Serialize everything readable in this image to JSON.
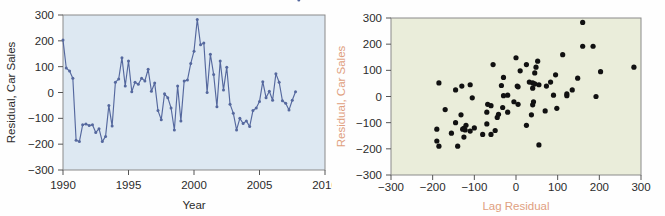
{
  "figure": {
    "background": "#fefefe",
    "panels": [
      "line-chart-residual-vs-year",
      "scatter-lag-residual"
    ]
  },
  "chart_data": [
    {
      "id": "left",
      "type": "line",
      "title": "",
      "subtitle": "",
      "xlabel": "Year",
      "ylabel": "Residual, Car Sales",
      "xlim": [
        1990,
        2010
      ],
      "ylim": [
        -300,
        300
      ],
      "xticks": [
        1990,
        1995,
        2000,
        2005,
        2010
      ],
      "xticklabels": [
        "1990",
        "1995",
        "2000",
        "2005",
        "2010"
      ],
      "yticks": [
        -300,
        -200,
        -100,
        0,
        100,
        200,
        300
      ],
      "yticklabels": [
        "−300",
        "−200",
        "−100",
        "0",
        "100",
        "200",
        "300"
      ],
      "grid": false,
      "legend": null,
      "plot_bgcolor": "#dde8f2",
      "line_color": "#55689e",
      "marker_color": "#55689e",
      "marker": "circle",
      "x": [
        1990.0,
        1990.25,
        1990.5,
        1990.75,
        1991.0,
        1991.25,
        1991.5,
        1991.75,
        1992.0,
        1992.25,
        1992.5,
        1992.75,
        1993.0,
        1993.25,
        1993.5,
        1993.75,
        1994.0,
        1994.25,
        1994.5,
        1994.75,
        1995.0,
        1995.25,
        1995.5,
        1995.75,
        1996.0,
        1996.25,
        1996.5,
        1996.75,
        1997.0,
        1997.25,
        1997.5,
        1997.75,
        1998.0,
        1998.25,
        1998.5,
        1998.75,
        1999.0,
        1999.25,
        1999.5,
        1999.75,
        2000.0,
        2000.25,
        2000.5,
        2000.75,
        2001.0,
        2001.25,
        2001.5,
        2001.75,
        2002.0,
        2002.25,
        2002.5,
        2002.75,
        2003.0,
        2003.25,
        2003.5,
        2003.75,
        2004.0,
        2004.25,
        2004.5,
        2004.75,
        2005.0,
        2005.25,
        2005.5,
        2005.75,
        2006.0,
        2006.25,
        2006.5,
        2006.75,
        2007.0,
        2007.25,
        2007.5,
        2007.75,
        2008.0
      ],
      "y": [
        203,
        95,
        83,
        55,
        -185,
        -190,
        -125,
        -122,
        -128,
        -125,
        -155,
        -140,
        -190,
        -170,
        -50,
        -130,
        40,
        52,
        135,
        25,
        122,
        3,
        40,
        32,
        55,
        45,
        90,
        5,
        37,
        -70,
        -105,
        -5,
        -20,
        -60,
        -145,
        25,
        -110,
        45,
        48,
        112,
        160,
        283,
        185,
        192,
        0,
        148,
        70,
        -55,
        122,
        10,
        98,
        -45,
        -80,
        -145,
        -100,
        -120,
        -110,
        -132,
        -70,
        -60,
        -35,
        42,
        -20,
        5,
        -30,
        73,
        40,
        -32,
        -42,
        -68,
        -30,
        3
      ]
    },
    {
      "id": "right",
      "type": "scatter",
      "title": "",
      "subtitle": "",
      "xlabel": "Lag Residual",
      "ylabel": "Residual, Car Sales",
      "xlim": [
        -300,
        300
      ],
      "ylim": [
        -300,
        300
      ],
      "xticks": [
        -300,
        -200,
        -100,
        0,
        100,
        200,
        300
      ],
      "xticklabels": [
        "−300",
        "−200",
        "−100",
        "0",
        "100",
        "200",
        "300"
      ],
      "yticks": [
        -300,
        -200,
        -100,
        0,
        100,
        200,
        300
      ],
      "yticklabels": [
        "−300",
        "−200",
        "−100",
        "0",
        "100",
        "200",
        "300"
      ],
      "grid": false,
      "legend": null,
      "plot_bgcolor": "#eaedda",
      "marker_color": "#111111",
      "marker": "circle",
      "axis_label_color": "#e0a080",
      "points": [
        [
          203,
          95
        ],
        [
          95,
          83
        ],
        [
          83,
          55
        ],
        [
          55,
          -185
        ],
        [
          -185,
          -190
        ],
        [
          -190,
          -125
        ],
        [
          -125,
          -122
        ],
        [
          -122,
          -128
        ],
        [
          -128,
          -125
        ],
        [
          -125,
          -155
        ],
        [
          -155,
          -140
        ],
        [
          -140,
          -190
        ],
        [
          -190,
          -170
        ],
        [
          -170,
          -50
        ],
        [
          -50,
          -130
        ],
        [
          -130,
          40
        ],
        [
          40,
          52
        ],
        [
          52,
          135
        ],
        [
          135,
          25
        ],
        [
          25,
          122
        ],
        [
          122,
          3
        ],
        [
          3,
          40
        ],
        [
          40,
          32
        ],
        [
          32,
          55
        ],
        [
          55,
          45
        ],
        [
          45,
          90
        ],
        [
          90,
          5
        ],
        [
          5,
          37
        ],
        [
          37,
          -70
        ],
        [
          -70,
          -105
        ],
        [
          -105,
          -5
        ],
        [
          -5,
          -20
        ],
        [
          -20,
          -60
        ],
        [
          -60,
          -145
        ],
        [
          -145,
          25
        ],
        [
          25,
          -110
        ],
        [
          -110,
          45
        ],
        [
          45,
          48
        ],
        [
          48,
          112
        ],
        [
          112,
          160
        ],
        [
          160,
          283
        ],
        [
          185,
          192
        ],
        [
          192,
          0
        ],
        [
          0,
          148
        ],
        [
          148,
          70
        ],
        [
          70,
          -55
        ],
        [
          -55,
          122
        ],
        [
          122,
          10
        ],
        [
          10,
          98
        ],
        [
          98,
          -45
        ],
        [
          -45,
          -80
        ],
        [
          -80,
          -145
        ],
        [
          -145,
          -100
        ],
        [
          -100,
          -120
        ],
        [
          -120,
          -110
        ],
        [
          -110,
          -132
        ],
        [
          -132,
          -70
        ],
        [
          -70,
          -60
        ],
        [
          -60,
          -35
        ],
        [
          -35,
          42
        ],
        [
          42,
          -20
        ],
        [
          -20,
          5
        ],
        [
          5,
          -30
        ],
        [
          -30,
          73
        ],
        [
          73,
          40
        ],
        [
          40,
          -32
        ],
        [
          -32,
          -42
        ],
        [
          -42,
          -68
        ],
        [
          -68,
          -30
        ],
        [
          -30,
          3
        ],
        [
          283,
          112
        ],
        [
          160,
          192
        ],
        [
          -185,
          52
        ]
      ]
    }
  ]
}
